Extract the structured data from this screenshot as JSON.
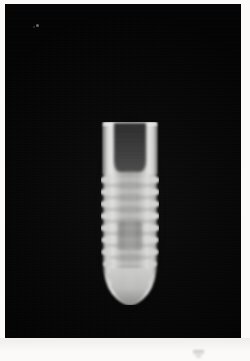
{
  "image": {
    "kind": "radiograph",
    "modality": "Dental periapical radiograph",
    "subject": "Endosseous threaded dental implant",
    "caption": "",
    "width": 250,
    "height": 361
  },
  "film": {
    "background_color": "#050505",
    "border_color": "#fbfaf8",
    "field_left": 5,
    "field_top": 4,
    "field_width": 236,
    "field_height": 334
  },
  "implant": {
    "label": "dental implant",
    "left": 96,
    "top": 118,
    "width": 58,
    "height": 183,
    "thread_count": 10,
    "body_color": "#b9b9b7",
    "bright_edge_color": "#d8d8d6",
    "chamber_color": "#3a3a3a",
    "parts": [
      {
        "name": "implant-collar",
        "label": "coronal collar"
      },
      {
        "name": "implant-internal-chamber",
        "label": "internal hex / screw chamber"
      },
      {
        "name": "implant-threaded-body",
        "label": "threaded body"
      },
      {
        "name": "implant-apex",
        "label": "apical tip"
      }
    ]
  },
  "artifacts": [
    {
      "name": "film-speck",
      "label": "emulsion speck",
      "x": 31,
      "y": 20
    },
    {
      "name": "margin-mark",
      "label": "faint margin mark",
      "x": 193,
      "y": 350
    }
  ],
  "colors": {
    "paper": "#fbfaf8",
    "film": "#050505",
    "metal_bright": "#e2e2e0",
    "metal_mid": "#b4b4b2",
    "metal_dark": "#3c3c3c"
  }
}
